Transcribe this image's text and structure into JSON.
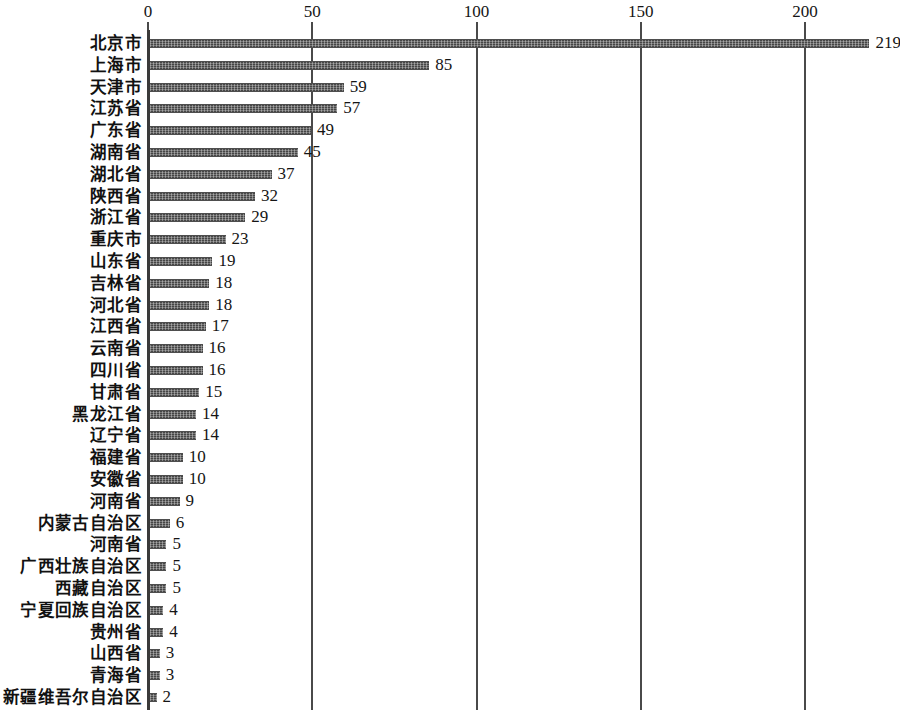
{
  "chart_data": {
    "type": "bar",
    "orientation": "horizontal",
    "title": "",
    "subtitle": "",
    "xlabel": "",
    "ylabel": "",
    "xlim": [
      0,
      219
    ],
    "axis_ticks": [
      0,
      50,
      100,
      150,
      200
    ],
    "axis_tick_labels": [
      "0",
      "50",
      "100",
      "150",
      "200"
    ],
    "axis_position": "top",
    "grid": true,
    "grid_orientation": "vertical",
    "legend": false,
    "data_labels": true,
    "bar_color": "#646464",
    "bar_pattern": "hatched",
    "categories": [
      "北京市",
      "上海市",
      "天津市",
      "江苏省",
      "广东省",
      "湖南省",
      "湖北省",
      "陕西省",
      "浙江省",
      "重庆市",
      "山东省",
      "吉林省",
      "河北省",
      "江西省",
      "云南省",
      "四川省",
      "甘肃省",
      "黑龙江省",
      "辽宁省",
      "福建省",
      "安徽省",
      "河南省",
      "内蒙古自治区",
      "河南省",
      "广西壮族自治区",
      "西藏自治区",
      "宁夏回族自治区",
      "贵州省",
      "山西省",
      "青海省",
      "新疆维吾尔自治区"
    ],
    "values": [
      219,
      85,
      59,
      57,
      49,
      45,
      37,
      32,
      29,
      23,
      19,
      18,
      18,
      17,
      16,
      16,
      15,
      14,
      14,
      10,
      10,
      9,
      6,
      5,
      5,
      5,
      4,
      4,
      3,
      3,
      2
    ],
    "value_labels": [
      "219",
      "85",
      "59",
      "57",
      "49",
      "45",
      "37",
      "32",
      "29",
      "23",
      "19",
      "18",
      "18",
      "17",
      "16",
      "16",
      "15",
      "14",
      "14",
      "10",
      "10",
      "9",
      "6",
      "5",
      "5",
      "5",
      "4",
      "4",
      "3",
      "3",
      "2"
    ]
  }
}
